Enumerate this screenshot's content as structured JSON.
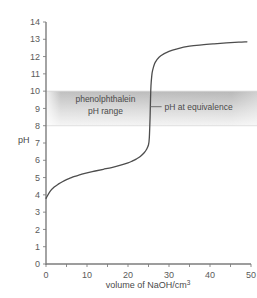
{
  "chart_data": {
    "type": "line",
    "title": "",
    "xlabel": "volume of NaOH/cm",
    "xlabel_sup": "3",
    "ylabel": "pH",
    "xlim": [
      0,
      50
    ],
    "ylim": [
      0,
      14
    ],
    "x_ticks_labeled": [
      0,
      10,
      20,
      30,
      40,
      50
    ],
    "x_ticks_minor": [
      5,
      15,
      25,
      35,
      45
    ],
    "y_ticks": [
      0,
      1,
      2,
      3,
      4,
      5,
      6,
      7,
      8,
      9,
      10,
      11,
      12,
      13,
      14
    ],
    "grid": false,
    "legend": "none",
    "series": [
      {
        "name": "titration curve",
        "color": "#4d4d4d",
        "x": [
          0,
          1,
          2,
          3,
          4,
          5,
          6,
          7,
          8,
          9,
          10,
          12,
          14,
          16,
          18,
          20,
          21,
          22,
          23,
          24,
          24.5,
          25,
          25.2,
          25.4,
          25.5,
          25.6,
          25.8,
          26,
          26.5,
          27,
          28,
          30,
          32,
          35,
          38,
          41,
          44,
          47,
          49
        ],
        "y": [
          3.8,
          4.2,
          4.45,
          4.62,
          4.76,
          4.88,
          4.98,
          5.07,
          5.14,
          5.21,
          5.27,
          5.38,
          5.48,
          5.58,
          5.7,
          5.85,
          5.95,
          6.07,
          6.22,
          6.45,
          6.62,
          6.9,
          7.3,
          8.6,
          9.6,
          10.3,
          10.9,
          11.2,
          11.6,
          11.8,
          12.05,
          12.3,
          12.45,
          12.6,
          12.68,
          12.74,
          12.79,
          12.83,
          12.85
        ]
      }
    ],
    "bands": [
      {
        "name": "phenolphthalein pH range",
        "y_from": 8,
        "y_to": 10,
        "fill_top": "#b8b8b8",
        "fill_bottom": "#f2f2f2"
      }
    ],
    "annotations": [
      {
        "name": "phenolphthalein-range-label",
        "line1": "phenolphthalein",
        "line2": "pH range",
        "x": 14.5,
        "y": 9.1
      },
      {
        "name": "equivalence-label",
        "text": "pH at equivalence",
        "x": 29,
        "y": 9.1,
        "leader_from_x": 25.5,
        "leader_to_x": 28.2,
        "leader_y": 9.1
      }
    ]
  },
  "colors": {
    "axis": "#7d7d7d",
    "curve": "#4d4d4d",
    "text": "#4a4a4a",
    "tick_text": "#5b5b5b",
    "band_top": "#b8b8b8",
    "band_bottom": "#f2f2f2",
    "background": "#ffffff"
  }
}
